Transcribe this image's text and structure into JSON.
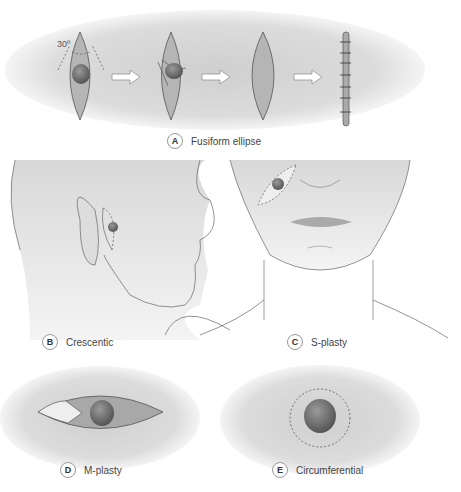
{
  "panels": {
    "A": {
      "letter": "A",
      "label": "Fusiform ellipse",
      "angle_label": "30º"
    },
    "B": {
      "letter": "B",
      "label": "Crescentic"
    },
    "C": {
      "letter": "C",
      "label": "S-plasty"
    },
    "D": {
      "letter": "D",
      "label": "M-plasty"
    },
    "E": {
      "letter": "E",
      "label": "Circumferential"
    }
  },
  "colors": {
    "background": "#ffffff",
    "shade": "#c8c8c8",
    "lesion": "#6e6e6e",
    "skin": "#e2e2e2",
    "line": "#555555"
  }
}
